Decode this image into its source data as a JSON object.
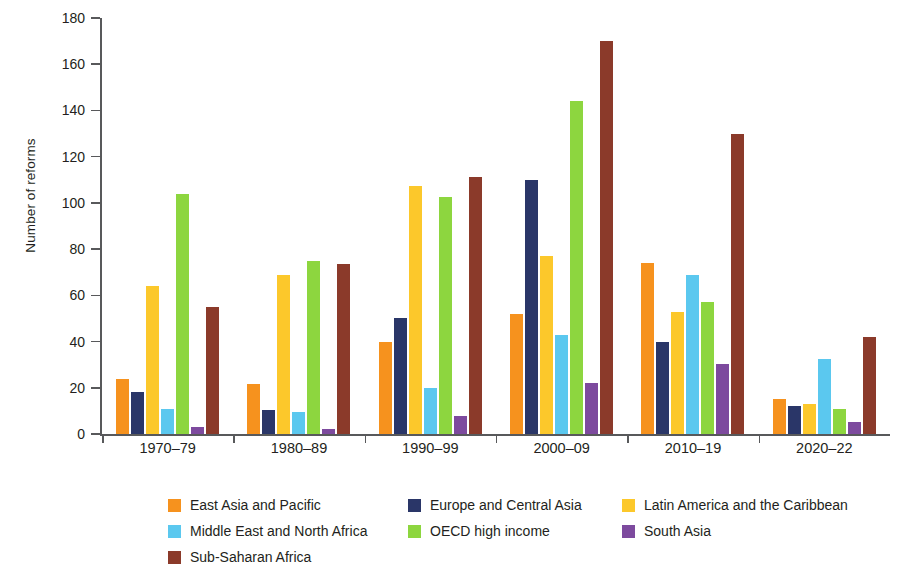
{
  "chart_data": {
    "type": "bar",
    "title": "",
    "xlabel": "",
    "ylabel": "Number of reforms",
    "ylim": [
      0,
      180
    ],
    "ytick_step": 20,
    "yticks": [
      0,
      20,
      40,
      60,
      80,
      100,
      120,
      140,
      160,
      180
    ],
    "grid": false,
    "legend_position": "bottom",
    "categories": [
      "1970–79",
      "1980–89",
      "1990–99",
      "2000–09",
      "2010–19",
      "2020–22"
    ],
    "series": [
      {
        "name": "East Asia and Pacific",
        "color": "#F6921E",
        "values": [
          24,
          21.5,
          40,
          52,
          74,
          15
        ]
      },
      {
        "name": "Europe and Central Asia",
        "color": "#2A3668",
        "values": [
          18,
          10.5,
          50,
          110,
          40,
          12
        ]
      },
      {
        "name": "Latin America and the Caribbean",
        "color": "#FCC82B",
        "values": [
          64,
          69,
          107.5,
          77,
          53,
          13
        ]
      },
      {
        "name": "Middle East and North Africa",
        "color": "#5BC8EF",
        "values": [
          11,
          9.5,
          20,
          43,
          69,
          32.5
        ]
      },
      {
        "name": "OECD high income",
        "color": "#8DD63F",
        "values": [
          104,
          75,
          102.5,
          144,
          57,
          11
        ]
      },
      {
        "name": "South Asia",
        "color": "#7D4A9E",
        "values": [
          3,
          2,
          8,
          22,
          30.5,
          5
        ]
      },
      {
        "name": "Sub-Saharan Africa",
        "color": "#8B3A2A",
        "values": [
          55,
          73.5,
          111,
          170,
          130,
          42
        ]
      }
    ]
  },
  "axis": {
    "y_title": "Number of reforms",
    "y_labels": [
      "180",
      "160",
      "140",
      "120",
      "100",
      "80",
      "60",
      "40",
      "20",
      "0"
    ],
    "x_labels": [
      "1970–79",
      "1980–89",
      "1990–99",
      "2000–09",
      "2010–19",
      "2020–22"
    ]
  },
  "legend": {
    "rows": [
      [
        {
          "label": "East Asia and Pacific",
          "color": "#F6921E",
          "icon": "legend-swatch"
        },
        {
          "label": "Europe and Central Asia",
          "color": "#2A3668",
          "icon": "legend-swatch"
        },
        {
          "label": "Latin America and the Caribbean",
          "color": "#FCC82B",
          "icon": "legend-swatch"
        }
      ],
      [
        {
          "label": "Middle East and North Africa",
          "color": "#5BC8EF",
          "icon": "legend-swatch"
        },
        {
          "label": "OECD high income",
          "color": "#8DD63F",
          "icon": "legend-swatch"
        },
        {
          "label": "South Asia",
          "color": "#7D4A9E",
          "icon": "legend-swatch"
        }
      ],
      [
        {
          "label": "Sub-Saharan Africa",
          "color": "#8B3A2A",
          "icon": "legend-swatch"
        }
      ]
    ]
  }
}
